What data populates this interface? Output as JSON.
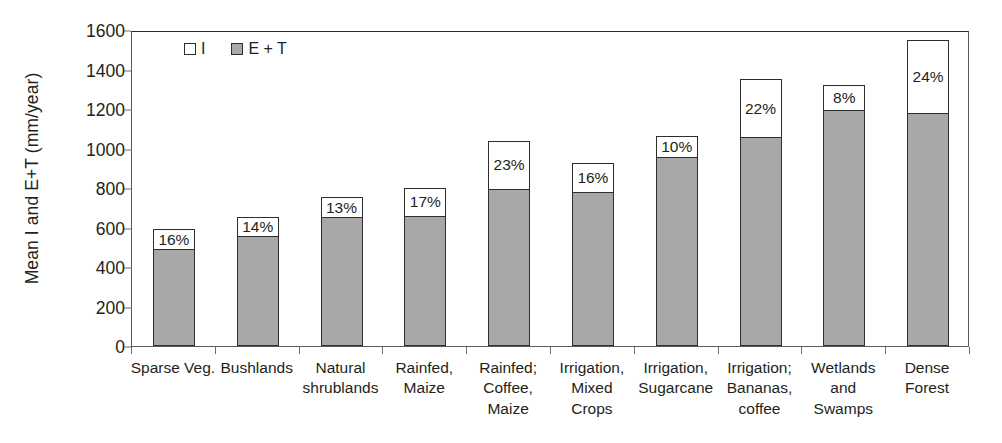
{
  "chart_data": {
    "type": "bar",
    "title": "",
    "subtitle": "",
    "xlabel": "",
    "ylabel": "Mean I and E+T (mm/year)",
    "ylim": [
      0,
      1600
    ],
    "ytick_step": 200,
    "yticks": [
      0,
      200,
      400,
      600,
      800,
      1000,
      1200,
      1400,
      1600
    ],
    "ytick_labels": [
      "0",
      "200",
      "400",
      "600",
      "800",
      "1000",
      "1200",
      "1400",
      "1600"
    ],
    "grid": false,
    "stacked": true,
    "legend_position": "top-left-inside",
    "colors": {
      "I": "#ffffff",
      "E + T": "#a8a8a8",
      "outline": "#2e2e2e",
      "axis": "#5a5a5a"
    },
    "legend": [
      {
        "label": "I",
        "swatch": "white"
      },
      {
        "label": "E + T",
        "swatch": "gray"
      }
    ],
    "categories": [
      "Sparse Veg.",
      "Bushlands",
      "Natural shrublands",
      "Rainfed, Maize",
      "Rainfed; Coffee, Maize",
      "Irrigation, Mixed Crops",
      "Irrigation, Sugarcane",
      "Irrigation; Bananas, coffee",
      "Wetlands and Swamps",
      "Dense Forest"
    ],
    "category_lines": [
      [
        "Sparse Veg."
      ],
      [
        "Bushlands"
      ],
      [
        "Natural",
        "shrublands"
      ],
      [
        "Rainfed,",
        "Maize"
      ],
      [
        "Rainfed;",
        "Coffee,",
        "Maize"
      ],
      [
        "Irrigation,",
        "Mixed",
        "Crops"
      ],
      [
        "Irrigation,",
        "Sugarcane"
      ],
      [
        "Irrigation;",
        "Bananas,",
        "coffee"
      ],
      [
        "Wetlands",
        "and",
        "Swamps"
      ],
      [
        "Dense",
        "Forest"
      ]
    ],
    "series": [
      {
        "name": "E + T",
        "values": [
          490,
          557,
          653,
          660,
          795,
          780,
          955,
          1060,
          1195,
          1180
        ]
      },
      {
        "name": "I",
        "values": [
          100,
          95,
          100,
          140,
          245,
          145,
          110,
          290,
          125,
          370
        ]
      }
    ],
    "totals": [
      590,
      652,
      753,
      800,
      1040,
      925,
      1065,
      1350,
      1320,
      1550
    ],
    "data_labels": [
      "16%",
      "14%",
      "13%",
      "17%",
      "23%",
      "16%",
      "10%",
      "22%",
      "8%",
      "24%"
    ]
  }
}
